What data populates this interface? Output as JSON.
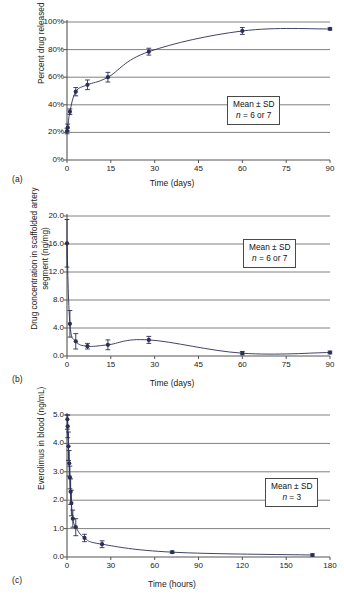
{
  "figure": {
    "background": "#ffffff",
    "series_color": "#2b2f55",
    "gridline_color": "#808080",
    "axis_color": "#555555"
  },
  "panels": [
    {
      "id": "a",
      "label": "(a)",
      "legend": {
        "line1": "Mean ± SD",
        "line2_prefix": "n",
        "line2_rest": " = 6 or 7"
      },
      "chart_data": {
        "type": "line",
        "title": "",
        "xlabel": "Time (days)",
        "ylabel": "Percent drug released",
        "xlim": [
          0,
          90
        ],
        "ylim": [
          0,
          100
        ],
        "xticks": [
          "0",
          "15",
          "30",
          "45",
          "60",
          "75",
          "90"
        ],
        "xtick_values": [
          0,
          15,
          30,
          45,
          60,
          75,
          90
        ],
        "yticks": [
          "0%",
          "20%",
          "40%",
          "60%",
          "80%",
          "100%"
        ],
        "ytick_values": [
          0,
          20,
          40,
          60,
          80,
          100
        ],
        "grid": true,
        "legend_position": "inside-right",
        "series": [
          {
            "name": "Percent drug released",
            "x": [
              0,
              0.25,
              1,
              3,
              7,
              14,
              28,
              60,
              90
            ],
            "y": [
              21,
              23.5,
              35,
              49.5,
              54.5,
              60,
              78.5,
              93.5,
              95
            ],
            "yerr": [
              2.0,
              2.5,
              2.0,
              3.0,
              3.5,
              3.5,
              2.5,
              2.5,
              0.8
            ]
          }
        ]
      }
    },
    {
      "id": "b",
      "label": "(b)",
      "legend": {
        "line1": "Mean ± SD",
        "line2_prefix": "n",
        "line2_rest": " = 6 or 7"
      },
      "chart_data": {
        "type": "line",
        "title": "",
        "xlabel": "Time (days)",
        "ylabel": "Drug concentration in scaffolded artery segment (ng/mg)",
        "xlim": [
          0,
          90
        ],
        "ylim": [
          0,
          20
        ],
        "xticks": [
          "0",
          "15",
          "30",
          "45",
          "60",
          "75",
          "90"
        ],
        "xtick_values": [
          0,
          15,
          30,
          45,
          60,
          75,
          90
        ],
        "yticks": [
          "0.0",
          "4.0",
          "8.0",
          "12.0",
          "16.0",
          "20.0"
        ],
        "ytick_values": [
          0,
          4,
          8,
          12,
          16,
          20
        ],
        "grid": true,
        "legend_position": "inside-right",
        "series": [
          {
            "name": "Drug concentration in scaffolded artery segment",
            "x": [
              0,
              1,
              3,
              7,
              14,
              28,
              60,
              90
            ],
            "y": [
              16.1,
              4.6,
              2.1,
              1.4,
              1.6,
              2.3,
              0.4,
              0.5
            ],
            "yerr": [
              3.4,
              1.9,
              1.1,
              0.4,
              0.7,
              0.5,
              0.25,
              0.2
            ]
          }
        ]
      }
    },
    {
      "id": "c",
      "label": "(c)",
      "legend": {
        "line1": "Mean ± SD",
        "line2_prefix": "n",
        "line2_rest": " = 3"
      },
      "chart_data": {
        "type": "line",
        "title": "",
        "xlabel": "Time (hours)",
        "ylabel": "Everolimus in blood (ng/mL)",
        "xlim": [
          0,
          180
        ],
        "ylim": [
          0,
          5
        ],
        "xticks": [
          "0",
          "30",
          "60",
          "90",
          "120",
          "150",
          "180"
        ],
        "xtick_values": [
          0,
          30,
          60,
          90,
          120,
          150,
          180
        ],
        "yticks": [
          "0.0",
          "1.0",
          "2.0",
          "3.0",
          "4.0",
          "5.0"
        ],
        "ytick_values": [
          0,
          1,
          2,
          3,
          4,
          5
        ],
        "grid": true,
        "legend_position": "inside-right",
        "series": [
          {
            "name": "Everolimus in blood",
            "x": [
              0.25,
              0.5,
              1,
              1.5,
              2,
              2.5,
              3,
              4,
              6,
              12,
              24,
              72,
              168
            ],
            "y": [
              4.85,
              4.6,
              3.9,
              3.3,
              2.8,
              2.3,
              1.9,
              1.35,
              1.05,
              0.67,
              0.45,
              0.17,
              0.07
            ],
            "yerr": [
              0.35,
              0.4,
              0.5,
              0.45,
              0.4,
              0.45,
              0.45,
              0.3,
              0.3,
              0.13,
              0.12,
              0.04,
              0.04
            ]
          }
        ]
      }
    }
  ]
}
